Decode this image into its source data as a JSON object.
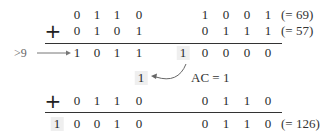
{
  "addend1": {
    "high_nibble": [
      "0",
      "1",
      "1",
      "0"
    ],
    "low_nibble": [
      "1",
      "0",
      "0",
      "1"
    ],
    "decimal": "(= 69)"
  },
  "addend2": {
    "operator": "+",
    "high_nibble": [
      "0",
      "1",
      "0",
      "1"
    ],
    "low_nibble": [
      "0",
      "1",
      "1",
      "1"
    ],
    "decimal": "(= 57)"
  },
  "sum1": {
    "condition": ">9",
    "high_nibble": [
      "1",
      "0",
      "1",
      "1"
    ],
    "carry": "1",
    "low_nibble": [
      "0",
      "0",
      "0",
      "0"
    ]
  },
  "carry_note": {
    "carry_digit": "1",
    "label": "AC = 1"
  },
  "correction": {
    "operator": "+",
    "high_nibble": [
      "0",
      "1",
      "1",
      "0"
    ],
    "low_nibble": [
      "0",
      "1",
      "1",
      "0"
    ]
  },
  "result": {
    "carry": "1",
    "high_nibble": [
      "0",
      "0",
      "1",
      "0"
    ],
    "low_nibble": [
      "0",
      "1",
      "1",
      "0"
    ],
    "decimal": "(= 126)"
  },
  "colors": {
    "text": "#2a2a2a",
    "shade": "#efefef",
    "rule": "#333333"
  }
}
